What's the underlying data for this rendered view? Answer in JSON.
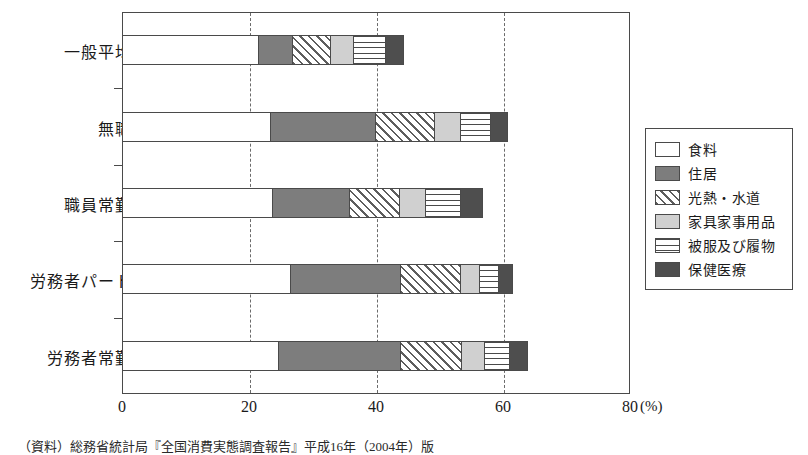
{
  "chart_data": {
    "type": "bar",
    "orientation": "horizontal",
    "stacked": true,
    "title": "",
    "xlabel": "(%)",
    "ylabel": "",
    "xlim": [
      0,
      80
    ],
    "xticks": [
      0,
      20,
      40,
      60,
      80
    ],
    "xtick_labels": [
      "0",
      "20",
      "40",
      "60",
      "80"
    ],
    "unit_label": "(%)",
    "grid": "vertical-dashed-at-20-40-60",
    "legend_position": "right",
    "categories": [
      "一般平均",
      "無職",
      "職員常勤",
      "労務者パート",
      "労務者常勤"
    ],
    "series": [
      {
        "name": "食料",
        "key": "shokuryo",
        "color": "#ffffff",
        "pattern": "solid-white",
        "values": [
          21.4,
          23.3,
          23.6,
          26.5,
          24.6
        ]
      },
      {
        "name": "住居",
        "key": "jukyo",
        "color": "#7d7d7d",
        "pattern": "solid-gray",
        "values": [
          5.4,
          16.5,
          12.1,
          17.3,
          19.2
        ]
      },
      {
        "name": "光熱・水道",
        "key": "konetsu",
        "color": "#ffffff",
        "pattern": "diagonal-hatch",
        "values": [
          6.0,
          9.4,
          7.9,
          9.4,
          9.6
        ]
      },
      {
        "name": "家具家事用品",
        "key": "kagu",
        "color": "#d0d0d0",
        "pattern": "solid-light-gray",
        "values": [
          3.6,
          4.1,
          4.1,
          3.0,
          3.6
        ]
      },
      {
        "name": "被服及び履物",
        "key": "hifuku",
        "color": "#ffffff",
        "pattern": "horizontal-lines",
        "values": [
          5.0,
          4.6,
          5.5,
          3.0,
          4.0
        ]
      },
      {
        "name": "保健医療",
        "key": "hoken",
        "color": "#4e4e4e",
        "pattern": "solid-dark-gray",
        "values": [
          3.0,
          2.9,
          3.7,
          2.4,
          2.9
        ]
      }
    ],
    "totals": [
      44.4,
      60.8,
      56.9,
      61.6,
      63.9
    ]
  },
  "legend": {
    "items": [
      {
        "label": "食料",
        "swatch": "sw-shokuryo"
      },
      {
        "label": "住居",
        "swatch": "sw-jukyo"
      },
      {
        "label": "光熱・水道",
        "swatch": "sw-konetsu"
      },
      {
        "label": "家具家事用品",
        "swatch": "sw-kagu"
      },
      {
        "label": "被服及び履物",
        "swatch": "sw-hifuku"
      },
      {
        "label": "保健医療",
        "swatch": "sw-hoken"
      }
    ]
  },
  "axis": {
    "ticks": [
      "0",
      "20",
      "40",
      "60",
      "80"
    ],
    "unit": "(%)"
  },
  "source": {
    "text": "（資料）総務省統計局『全国消費実態調査報告』平成16年（2004年）版"
  }
}
